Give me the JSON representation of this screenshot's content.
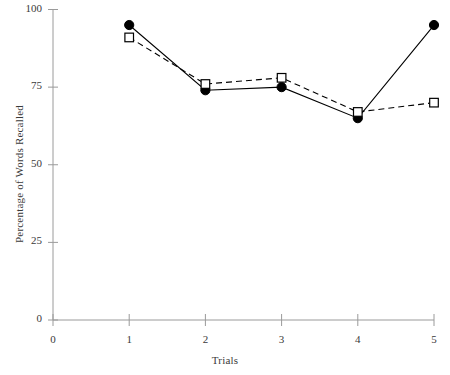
{
  "chart_data": {
    "type": "line",
    "title": "",
    "xlabel": "Trials",
    "ylabel": "Percentage of Words Recalled",
    "x": [
      1,
      2,
      3,
      4,
      5
    ],
    "categories": [
      "1",
      "2",
      "3",
      "4",
      "5"
    ],
    "xtick_labels": [
      "0",
      "1",
      "2",
      "3",
      "4",
      "5"
    ],
    "xtick_values": [
      0,
      1,
      2,
      3,
      4,
      5
    ],
    "ytick_labels": [
      "0",
      "25",
      "50",
      "75",
      "100"
    ],
    "ytick_values": [
      0,
      25,
      50,
      75,
      100
    ],
    "xlim": [
      0,
      5
    ],
    "ylim": [
      0,
      100
    ],
    "grid": false,
    "legend": "none",
    "series": [
      {
        "name": "filled-circle-series",
        "marker": "filled-circle",
        "linestyle": "solid",
        "color": "#000000",
        "values": [
          95,
          74,
          75,
          65,
          95
        ]
      },
      {
        "name": "open-square-series",
        "marker": "open-square",
        "linestyle": "dashed",
        "color": "#000000",
        "values": [
          91,
          76,
          78,
          67,
          70
        ]
      }
    ]
  },
  "axes": {
    "y_axis_title": "Percentage of Words Recalled",
    "x_axis_title": "Trials"
  },
  "colors": {
    "line": "#000000",
    "axis": "#9a9a9a",
    "text": "#3a3a3a",
    "background": "#ffffff"
  }
}
